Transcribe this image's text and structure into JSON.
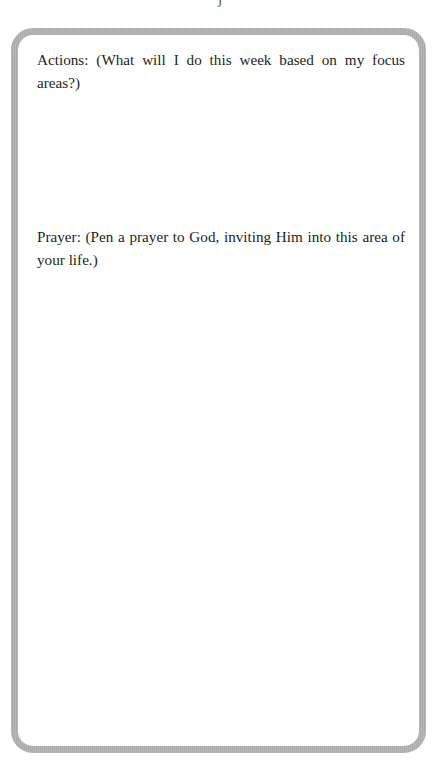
{
  "page": {
    "top_mark": "j"
  },
  "frame": {
    "border_color": "#b1b1b1",
    "background_color": "#ffffff"
  },
  "sections": {
    "actions": {
      "prompt": "Actions: (What will I do this week based on my focus areas?)"
    },
    "prayer": {
      "prompt": "Prayer: (Pen a prayer to God, inviting Him into this area of your life.)"
    }
  }
}
